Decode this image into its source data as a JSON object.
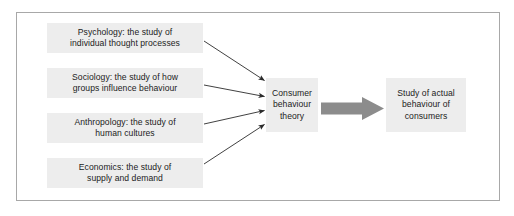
{
  "diagram": {
    "frame": {
      "border_color": "#a8a8a8",
      "background": "#ffffff"
    },
    "node_fill": "#ededed",
    "text_color": "#1c1c1c",
    "thin_arrow_color": "#2b2b2b",
    "block_arrow_color": "#8c8c8c",
    "sources": [
      {
        "id": "psychology",
        "line1": "Psychology: the study of",
        "line2": "individual thought processes"
      },
      {
        "id": "sociology",
        "line1": "Sociology: the study of how",
        "line2": "groups influence behaviour"
      },
      {
        "id": "anthropology",
        "line1": "Anthropology: the study of",
        "line2": "human cultures"
      },
      {
        "id": "economics",
        "line1": "Economics: the study of",
        "line2": "supply and demand"
      }
    ],
    "theory": {
      "line1": "Consumer",
      "line2": "behaviour",
      "line3": "theory"
    },
    "outcome": {
      "line1": "Study of actual",
      "line2": "behaviour of",
      "line3": "consumers"
    }
  }
}
